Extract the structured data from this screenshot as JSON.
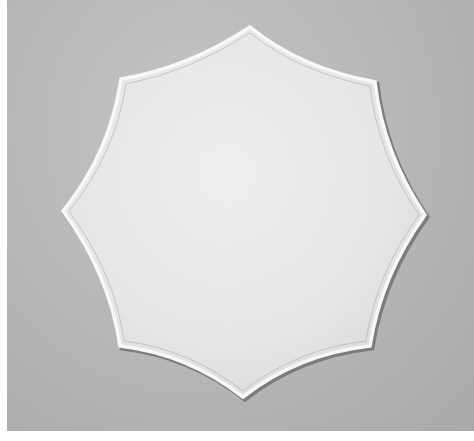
{
  "image": {
    "subject": "eight-pointed star with concave edges and raised rim",
    "alt": "Eight-pointed concave star shape with a raised white rim on a gray textured background",
    "colors": {
      "background": "#b6b6b6",
      "star_fill": "#e9e9e9",
      "rim_highlight": "#f7f7f7",
      "rim_shadow": "#7a7a7a",
      "border": "#ffffff"
    },
    "star_points": [
      {
        "name": "top",
        "x": 250,
        "y": 27
      },
      {
        "name": "top-right",
        "x": 375,
        "y": 82
      },
      {
        "name": "right",
        "x": 425,
        "y": 215
      },
      {
        "name": "bottom-right",
        "x": 370,
        "y": 346
      },
      {
        "name": "bottom",
        "x": 243,
        "y": 397
      },
      {
        "name": "bottom-left",
        "x": 120,
        "y": 346
      },
      {
        "name": "left",
        "x": 63,
        "y": 211
      },
      {
        "name": "top-left",
        "x": 121,
        "y": 79
      }
    ]
  }
}
